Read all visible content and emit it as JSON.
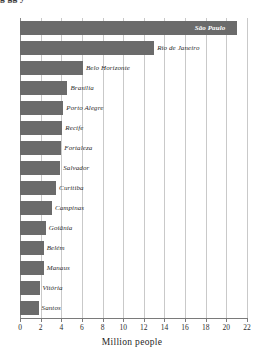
{
  "title_fragment": "g                    gg                        y",
  "chart_data": {
    "type": "bar",
    "orientation": "horizontal",
    "title": "",
    "xlabel": "Million people",
    "ylabel": "",
    "xlim": [
      0,
      22
    ],
    "xticks": [
      0,
      2,
      4,
      6,
      8,
      10,
      12,
      14,
      16,
      18,
      20,
      22
    ],
    "grid": true,
    "legend": false,
    "bar_color": "#6b6b6b",
    "categories": [
      "São Paulo",
      "Rio de Janeiro",
      "Belo Horizonte",
      "Brasília",
      "Porto Alegre",
      "Recife",
      "Fortaleza",
      "Salvador",
      "Curitiba",
      "Campinas",
      "Goiânia",
      "Belém",
      "Manaus",
      "Vitória",
      "Santos"
    ],
    "values": [
      21.0,
      13.0,
      6.1,
      4.6,
      4.2,
      4.1,
      4.0,
      3.9,
      3.5,
      3.1,
      2.5,
      2.3,
      2.3,
      1.9,
      1.8
    ]
  }
}
